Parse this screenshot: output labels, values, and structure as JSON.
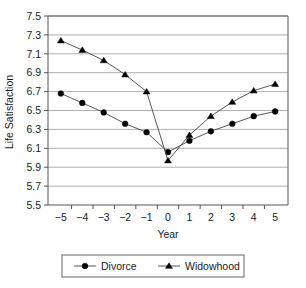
{
  "chart_data": {
    "type": "line",
    "title": "",
    "xlabel": "Year",
    "ylabel": "Life Satisfaction",
    "x": [
      -5,
      -4,
      -3,
      -2,
      -1,
      0,
      1,
      2,
      3,
      4,
      5
    ],
    "xticklabels": [
      "−5",
      "−4",
      "−3",
      "−2",
      "−1",
      "0",
      "1",
      "2",
      "3",
      "4",
      "5"
    ],
    "xlim": [
      -5.6,
      5.6
    ],
    "ylim": [
      5.5,
      7.5
    ],
    "yticks": [
      5.5,
      5.7,
      5.9,
      6.1,
      6.3,
      6.5,
      6.7,
      6.9,
      7.1,
      7.3,
      7.5
    ],
    "yticklabels": [
      "5.5",
      "5.7",
      "5.9",
      "6.1",
      "6.3",
      "6.5",
      "6.7",
      "6.9",
      "7.1",
      "7.3",
      "7.5"
    ],
    "grid": "horizontal",
    "legend_position": "bottom",
    "series": [
      {
        "name": "Divorce",
        "marker": "circle",
        "color": "#000000",
        "values": [
          6.68,
          6.58,
          6.48,
          6.36,
          6.27,
          6.06,
          6.18,
          6.28,
          6.36,
          6.44,
          6.49
        ]
      },
      {
        "name": "Widowhood",
        "marker": "triangle",
        "color": "#000000",
        "values": [
          7.24,
          7.14,
          7.03,
          6.88,
          6.7,
          5.97,
          6.24,
          6.44,
          6.59,
          6.71,
          6.78
        ]
      }
    ]
  },
  "axes": {
    "xlabel": "Year",
    "ylabel": "Life Satisfaction"
  },
  "legend": {
    "items": [
      {
        "label": "Divorce",
        "marker": "circle"
      },
      {
        "label": "Widowhood",
        "marker": "triangle"
      }
    ]
  }
}
